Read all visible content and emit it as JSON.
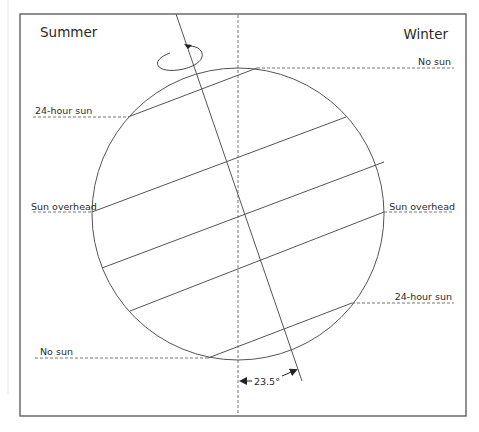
{
  "diagram": {
    "title_left": "Summer",
    "title_right": "Winter",
    "labels": {
      "top_right_no_sun": "No sun",
      "left_24_hour_sun": "24-hour sun",
      "left_sun_overhead": "Sun overhead",
      "right_sun_overhead": "Sun overhead",
      "right_24_hour_sun": "24-hour sun",
      "bottom_left_no_sun": "No sun"
    },
    "tilt_angle_label": "23.5°",
    "tilt_angle_degrees": 23.5,
    "colors": {
      "line": "#555555",
      "frame": "#555555",
      "text": "#2a2a2a"
    }
  }
}
